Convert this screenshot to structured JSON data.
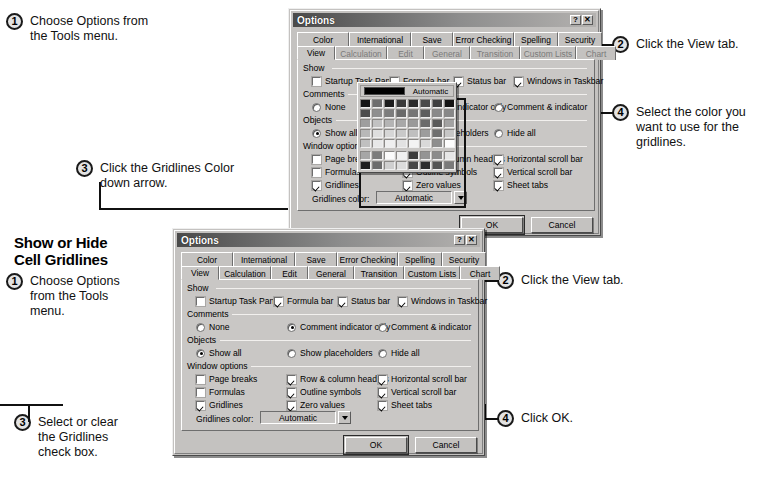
{
  "document": {
    "section_heading": "Show or Hide\nCell Gridlines"
  },
  "procedure_one": {
    "steps": [
      {
        "number": "1",
        "text": "Choose Options from\nthe Tools menu."
      },
      {
        "number": "2",
        "text": "Click the View tab."
      },
      {
        "number": "3",
        "text": "Click the Gridlines Color\ndown arrow."
      },
      {
        "number": "4",
        "text": "Select the color you\nwant to use for the\ngridlines."
      },
      {
        "number": "5",
        "text": "Click OK."
      }
    ]
  },
  "procedure_two": {
    "heading_line1": "Show or Hide",
    "heading_line2": "Cell Gridlines",
    "steps": [
      {
        "number": "1",
        "text": "Choose Options\nfrom the Tools\nmenu."
      },
      {
        "number": "2",
        "text": "Click the View tab."
      },
      {
        "number": "3",
        "text": "Select or clear\nthe Gridlines\ncheck box."
      },
      {
        "number": "4",
        "text": "Click OK."
      }
    ]
  },
  "dialog": {
    "title": "Options",
    "titlebar_buttons": [
      {
        "name": "help-button",
        "glyph": "?"
      },
      {
        "name": "close-button",
        "glyph": "✕"
      }
    ],
    "tabs_row1": [
      "Color",
      "International",
      "Save",
      "Error Checking",
      "Spelling",
      "Security"
    ],
    "tabs_row2": [
      "View",
      "Calculation",
      "Edit",
      "General",
      "Transition",
      "Custom Lists",
      "Chart"
    ],
    "selected_tab": "View",
    "groups": {
      "show": {
        "label": "Show",
        "items": [
          {
            "label": "Startup Task Pane",
            "checked": false,
            "accel": "u"
          },
          {
            "label": "Formula bar",
            "checked": true,
            "accel": "F"
          },
          {
            "label": "Status bar",
            "checked": true,
            "accel": "S"
          },
          {
            "label": "Windows in Taskbar",
            "checked": true,
            "accel": "W"
          }
        ]
      },
      "comments": {
        "label": "Comments",
        "items": [
          {
            "label": "None",
            "selected": false
          },
          {
            "label": "Comment indicator only",
            "selected": true
          },
          {
            "label": "Comment & indicator",
            "selected": false
          }
        ]
      },
      "objects": {
        "label": "Objects",
        "items": [
          {
            "label": "Show all",
            "selected": true
          },
          {
            "label": "Show placeholders",
            "selected": false
          },
          {
            "label": "Hide all",
            "selected": false
          }
        ]
      },
      "window_options": {
        "label": "Window options",
        "items": [
          {
            "label": "Page breaks",
            "checked": false
          },
          {
            "label": "Row & column headers",
            "checked": true
          },
          {
            "label": "Horizontal scroll bar",
            "checked": true
          },
          {
            "label": "Formulas",
            "checked": false
          },
          {
            "label": "Outline symbols",
            "checked": true
          },
          {
            "label": "Vertical scroll bar",
            "checked": true
          },
          {
            "label": "Gridlines",
            "checked": true
          },
          {
            "label": "Zero values",
            "checked": true
          },
          {
            "label": "Sheet tabs",
            "checked": true
          }
        ],
        "gridlines_color_label": "Gridlines color:",
        "gridlines_color_value": "Automatic"
      }
    },
    "buttons": {
      "ok": "OK",
      "cancel": "Cancel"
    }
  },
  "palette": {
    "automatic_label": "Automatic",
    "swatches": [
      "#161616",
      "#6e6e6e",
      "#1c1c1c",
      "#3a3a3a",
      "#2a2a2a",
      "#4a4a4a",
      "#3f3f3f",
      "#141414",
      "#4d4d4d",
      "#8f8f8f",
      "#7d7d7d",
      "#6a6a6a",
      "#757575",
      "#5e5e5e",
      "#8a8a8a",
      "#888888",
      "#9e9e9e",
      "#c2c2c2",
      "#b4b4b4",
      "#a8a8a8",
      "#9a9a9a",
      "#6b6b6b",
      "#5a5a5a",
      "#a2a2a2",
      "#b8b8b8",
      "#dedede",
      "#d6d6d6",
      "#c9c9c9",
      "#bfbfbf",
      "#9d9d9d",
      "#6f6f6f",
      "#c6c6c6",
      "#c0c0c0",
      "#e8e8e8",
      "#efefef",
      "#e2e2e2",
      "#f3f3f3",
      "#d9d9d9",
      "#8e8e8e",
      "#fdfdfd"
    ],
    "swatches_bottom": [
      "#a6a6a6",
      "#7c7c7c",
      "#fbfbfb",
      "#f0f0f0",
      "#3c3c3c",
      "#949494",
      "#8b8b8b",
      "#e6e6e6",
      "#1f1f1f",
      "#6c6c6c",
      "#cfcfcf",
      "#dcdcdc",
      "#474747",
      "#2e2e2e",
      "#545454",
      "#7a7a7a"
    ]
  }
}
